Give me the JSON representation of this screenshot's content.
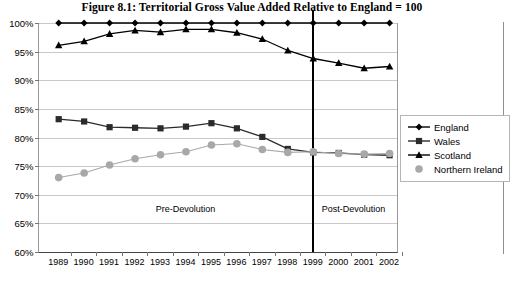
{
  "figure": {
    "title": "Figure 8.1: Territorial Gross Value Added Relative to England = 100"
  },
  "annotations": {
    "pre": "Pre-Devolution",
    "post": "Post-Devolution",
    "divider_year": "1999"
  },
  "legend": {
    "items": [
      {
        "label": "England",
        "marker": "diamond-marker",
        "color": "#000000"
      },
      {
        "label": "Wales",
        "marker": "square-marker",
        "color": "#2b2b2b"
      },
      {
        "label": "Scotland",
        "marker": "triangle-marker",
        "color": "#000000"
      },
      {
        "label": "Northern Ireland",
        "marker": "circle-marker",
        "color": "#a8a8a8"
      }
    ]
  },
  "chart_data": {
    "type": "line",
    "title": "Figure 8.1: Territorial Gross Value Added Relative to England = 100",
    "xlabel": "",
    "ylabel": "",
    "ylim": [
      60,
      100
    ],
    "ytick_step": 5,
    "ytick_labels": [
      "60%",
      "65%",
      "70%",
      "75%",
      "80%",
      "85%",
      "90%",
      "95%",
      "100%"
    ],
    "ytick_values": [
      60,
      65,
      70,
      75,
      80,
      85,
      90,
      95,
      100
    ],
    "grid": true,
    "legend_position": "right",
    "categories": [
      "1989",
      "1990",
      "1991",
      "1992",
      "1993",
      "1994",
      "1995",
      "1996",
      "1997",
      "1998",
      "1999",
      "2000",
      "2001",
      "2002"
    ],
    "x": [
      1989,
      1990,
      1991,
      1992,
      1993,
      1994,
      1995,
      1996,
      1997,
      1998,
      1999,
      2000,
      2001,
      2002
    ],
    "series": [
      {
        "name": "England",
        "color": "#000000",
        "marker": "diamond",
        "values": [
          100,
          100,
          100,
          100,
          100,
          100,
          100,
          100,
          100,
          100,
          100,
          100,
          100,
          100
        ]
      },
      {
        "name": "Scotland",
        "color": "#000000",
        "marker": "triangle",
        "values": [
          96.1,
          96.8,
          98.1,
          98.7,
          98.4,
          98.9,
          98.9,
          98.3,
          97.2,
          95.2,
          93.8,
          93.0,
          92.1,
          92.4
        ]
      },
      {
        "name": "Wales",
        "color": "#2b2b2b",
        "marker": "square",
        "values": [
          83.2,
          82.8,
          81.8,
          81.7,
          81.6,
          81.9,
          82.5,
          81.6,
          80.1,
          78.0,
          77.4,
          77.3,
          77.0,
          76.9
        ]
      },
      {
        "name": "Northern Ireland",
        "color": "#a8a8a8",
        "marker": "circle",
        "values": [
          73.0,
          73.8,
          75.2,
          76.3,
          77.0,
          77.5,
          78.7,
          78.9,
          77.9,
          77.4,
          77.5,
          77.2,
          77.1,
          77.2
        ]
      }
    ],
    "annotations": [
      {
        "text": "Pre-Devolution",
        "x": 1994.0,
        "y": 67.5
      },
      {
        "text": "Post-Devolution",
        "x": 2000.6,
        "y": 67.5
      },
      {
        "text": "devolution-divider",
        "x": 1999,
        "type": "vline"
      }
    ]
  }
}
